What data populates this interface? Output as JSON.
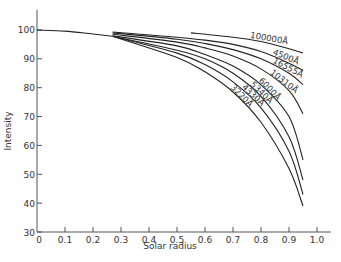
{
  "chart_data": {
    "type": "line",
    "title": "",
    "xlabel": "Solar radius",
    "ylabel": "Intensity",
    "xlim": [
      0,
      1.05
    ],
    "ylim": [
      30,
      107
    ],
    "xticks": [
      0,
      0.1,
      0.2,
      0.3,
      0.4,
      0.5,
      0.6,
      0.7,
      0.8,
      0.9,
      1.0
    ],
    "xtick_labels": [
      "0",
      "0.1",
      "0.2",
      "0.3",
      "0.4",
      "0.5",
      "0.6",
      "0.7",
      "0.8",
      "0.9",
      "1.0"
    ],
    "yticks": [
      30,
      40,
      50,
      60,
      70,
      80,
      90,
      100
    ],
    "ytick_labels": [
      "30",
      "40",
      "50",
      "60",
      "70",
      "80",
      "90",
      "100"
    ],
    "grid": false,
    "legend": "none (curves labelled inline at upper-right ends)",
    "common_segment": {
      "name": "all wavelengths",
      "x": [
        0,
        0.1,
        0.2,
        0.27
      ],
      "y": [
        100,
        99.6,
        98.6,
        97.8
      ]
    },
    "series": [
      {
        "name": "100000Å",
        "label": "100000Å",
        "x": [
          0.55,
          0.7,
          0.8,
          0.9,
          0.95
        ],
        "y": [
          99.0,
          97.5,
          96.0,
          93.5,
          92.0
        ]
      },
      {
        "name": "4500Å",
        "label": "4500Å",
        "x": [
          0.27,
          0.5,
          0.6,
          0.7,
          0.8,
          0.9,
          0.95
        ],
        "y": [
          99.3,
          97.5,
          96.5,
          95.0,
          92.5,
          88.5,
          86.0
        ]
      },
      {
        "name": "16555Å",
        "label": "16555Å",
        "x": [
          0.27,
          0.5,
          0.6,
          0.7,
          0.8,
          0.9,
          0.95
        ],
        "y": [
          99.0,
          96.8,
          95.3,
          93.2,
          90.0,
          85.0,
          81.0
        ]
      },
      {
        "name": "10310Å",
        "label": "10310Å",
        "x": [
          0.27,
          0.5,
          0.6,
          0.7,
          0.8,
          0.9,
          0.95
        ],
        "y": [
          98.5,
          95.8,
          93.8,
          91.0,
          86.5,
          79.0,
          71.0
        ]
      },
      {
        "name": "6000Å",
        "label": "6000Å",
        "x": [
          0.27,
          0.5,
          0.6,
          0.7,
          0.8,
          0.9,
          0.95
        ],
        "y": [
          98.0,
          94.5,
          91.5,
          87.5,
          81.0,
          70.0,
          55.0
        ]
      },
      {
        "name": "5340Å",
        "label": "5340Å",
        "x": [
          0.27,
          0.5,
          0.6,
          0.7,
          0.8,
          0.9,
          0.95
        ],
        "y": [
          97.8,
          93.0,
          90.0,
          85.0,
          77.0,
          63.0,
          48.0
        ]
      },
      {
        "name": "4330Å",
        "label": "4330Å",
        "x": [
          0.27,
          0.5,
          0.6,
          0.7,
          0.8,
          0.9,
          0.95
        ],
        "y": [
          97.8,
          92.0,
          88.0,
          82.0,
          73.0,
          58.0,
          43.0
        ]
      },
      {
        "name": "3220Å",
        "label": "3220Å",
        "x": [
          0.27,
          0.5,
          0.6,
          0.7,
          0.8,
          0.9,
          0.95
        ],
        "y": [
          97.8,
          90.5,
          85.5,
          78.5,
          68.0,
          52.0,
          39.0
        ]
      }
    ]
  }
}
